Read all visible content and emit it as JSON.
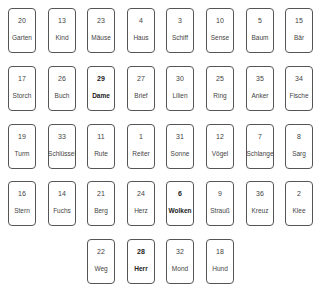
{
  "cards": [
    {
      "n": "20",
      "name": "Garten",
      "row": 0,
      "col": 0
    },
    {
      "n": "13",
      "name": "Kind",
      "row": 0,
      "col": 1
    },
    {
      "n": "23",
      "name": "Mäuse",
      "row": 0,
      "col": 2
    },
    {
      "n": "4",
      "name": "Haus",
      "row": 0,
      "col": 3
    },
    {
      "n": "3",
      "name": "Schiff",
      "row": 0,
      "col": 4
    },
    {
      "n": "10",
      "name": "Sense",
      "row": 0,
      "col": 5
    },
    {
      "n": "5",
      "name": "Baum",
      "row": 0,
      "col": 6
    },
    {
      "n": "15",
      "name": "Bär",
      "row": 0,
      "col": 7
    },
    {
      "n": "17",
      "name": "Storch",
      "row": 1,
      "col": 0
    },
    {
      "n": "26",
      "name": "Buch",
      "row": 1,
      "col": 1
    },
    {
      "n": "29",
      "name": "Dame",
      "row": 1,
      "col": 2,
      "bold": true
    },
    {
      "n": "27",
      "name": "Brief",
      "row": 1,
      "col": 3
    },
    {
      "n": "30",
      "name": "Lilien",
      "row": 1,
      "col": 4
    },
    {
      "n": "25",
      "name": "Ring",
      "row": 1,
      "col": 5
    },
    {
      "n": "35",
      "name": "Anker",
      "row": 1,
      "col": 6
    },
    {
      "n": "34",
      "name": "Fische",
      "row": 1,
      "col": 7
    },
    {
      "n": "19",
      "name": "Turm",
      "row": 2,
      "col": 0
    },
    {
      "n": "33",
      "name": "Schlüssel",
      "row": 2,
      "col": 1
    },
    {
      "n": "11",
      "name": "Rute",
      "row": 2,
      "col": 2
    },
    {
      "n": "1",
      "name": "Reiter",
      "row": 2,
      "col": 3
    },
    {
      "n": "31",
      "name": "Sonne",
      "row": 2,
      "col": 4
    },
    {
      "n": "12",
      "name": "Vögel",
      "row": 2,
      "col": 5
    },
    {
      "n": "7",
      "name": "Schlange",
      "row": 2,
      "col": 6
    },
    {
      "n": "8",
      "name": "Sarg",
      "row": 2,
      "col": 7
    },
    {
      "n": "16",
      "name": "Stern",
      "row": 3,
      "col": 0
    },
    {
      "n": "14",
      "name": "Fuchs",
      "row": 3,
      "col": 1
    },
    {
      "n": "21",
      "name": "Berg",
      "row": 3,
      "col": 2
    },
    {
      "n": "24",
      "name": "Herz",
      "row": 3,
      "col": 3
    },
    {
      "n": "6",
      "name": "Wolken",
      "row": 3,
      "col": 4,
      "bold": true
    },
    {
      "n": "9",
      "name": "Strauß",
      "row": 3,
      "col": 5
    },
    {
      "n": "36",
      "name": "Kreuz",
      "row": 3,
      "col": 6
    },
    {
      "n": "2",
      "name": "Klee",
      "row": 3,
      "col": 7
    },
    {
      "n": "22",
      "name": "Weg",
      "row": 4,
      "col": 2
    },
    {
      "n": "28",
      "name": "Herr",
      "row": 4,
      "col": 3,
      "bold": true
    },
    {
      "n": "32",
      "name": "Mond",
      "row": 4,
      "col": 4
    },
    {
      "n": "18",
      "name": "Hund",
      "row": 4,
      "col": 5
    }
  ]
}
